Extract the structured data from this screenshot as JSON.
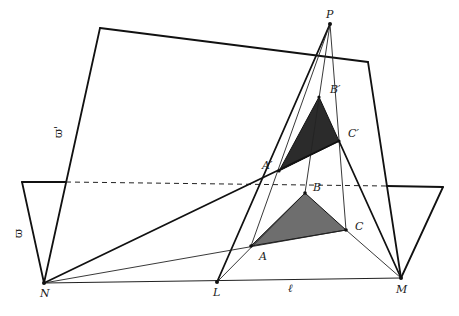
{
  "figure": {
    "colors": {
      "line": "#111111",
      "triangle_upper_fill": "#2b2b2b",
      "triangle_lower_fill": "#6e6e6e",
      "background": "#ffffff"
    },
    "planes": [
      {
        "label": "ϖ'",
        "name": "upper-plane"
      },
      {
        "label": "ϖ",
        "name": "lower-plane"
      }
    ],
    "line_label": "ℓ",
    "points": {
      "P": {
        "label": "P",
        "x": 330,
        "y": 24
      },
      "A_prime": {
        "label": "A′",
        "x": 279,
        "y": 171
      },
      "B_prime": {
        "label": "B′",
        "x": 319,
        "y": 97
      },
      "C_prime": {
        "label": "C′",
        "x": 339,
        "y": 141
      },
      "A": {
        "label": "A",
        "x": 251,
        "y": 246
      },
      "B": {
        "label": "B",
        "x": 305,
        "y": 193
      },
      "C": {
        "label": "C",
        "x": 346,
        "y": 230
      },
      "N": {
        "label": "N",
        "x": 44,
        "y": 283
      },
      "L": {
        "label": "L",
        "x": 217,
        "y": 282
      },
      "M": {
        "label": "M",
        "x": 401,
        "y": 278
      }
    }
  }
}
